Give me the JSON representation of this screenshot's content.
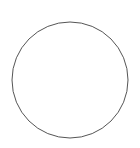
{
  "canvas": {
    "width": 140,
    "height": 148,
    "background": "#ffffff"
  },
  "shapes": [
    {
      "type": "circle",
      "cx": 70,
      "cy": 80,
      "r": 58,
      "fill": "#ffffff",
      "stroke": "#555555",
      "stroke_width": 1
    }
  ]
}
